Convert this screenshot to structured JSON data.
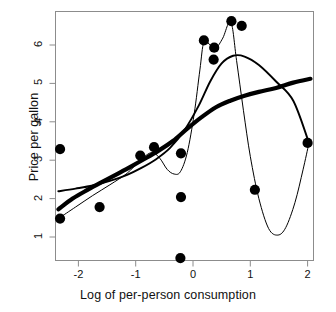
{
  "chart_data": {
    "type": "scatter",
    "title": "",
    "xlabel": "Log of per-person consumption",
    "ylabel": "Price per gallon",
    "xlim": [
      -2.62,
      -2.62
    ],
    "x_range": [
      -2.62,
      2.27
    ],
    "y_range": [
      0.2,
      6.95
    ],
    "xticks": [
      -2,
      -1,
      0,
      1,
      2
    ],
    "xtick_labels": [
      "-2",
      "-1",
      "0",
      "1",
      "2"
    ],
    "yticks": [
      1,
      2,
      3,
      4,
      5,
      6
    ],
    "ytick_labels": [
      "1",
      "2",
      "3",
      "4",
      "5",
      "6"
    ],
    "grid": false,
    "legend": "none",
    "points": [
      {
        "x": -2.32,
        "y": 3.29
      },
      {
        "x": -2.32,
        "y": 1.48
      },
      {
        "x": -1.63,
        "y": 1.78
      },
      {
        "x": -0.92,
        "y": 3.12
      },
      {
        "x": -0.68,
        "y": 3.34
      },
      {
        "x": -0.21,
        "y": 3.18
      },
      {
        "x": -0.21,
        "y": 2.04
      },
      {
        "x": -0.22,
        "y": 0.45
      },
      {
        "x": 0.19,
        "y": 6.12
      },
      {
        "x": 0.37,
        "y": 5.93
      },
      {
        "x": 0.36,
        "y": 5.62
      },
      {
        "x": 0.67,
        "y": 6.62
      },
      {
        "x": 0.85,
        "y": 6.5
      },
      {
        "x": 1.08,
        "y": 2.23
      },
      {
        "x": 2.0,
        "y": 3.45
      }
    ],
    "series": [
      {
        "name": "thick-smooth-curve",
        "type": "line",
        "style": "thick",
        "points": [
          {
            "x": -2.35,
            "y": 1.72
          },
          {
            "x": -2.1,
            "y": 2.0
          },
          {
            "x": -1.85,
            "y": 2.22
          },
          {
            "x": -1.6,
            "y": 2.42
          },
          {
            "x": -1.35,
            "y": 2.62
          },
          {
            "x": -1.1,
            "y": 2.82
          },
          {
            "x": -0.85,
            "y": 3.03
          },
          {
            "x": -0.6,
            "y": 3.25
          },
          {
            "x": -0.35,
            "y": 3.5
          },
          {
            "x": -0.1,
            "y": 3.82
          },
          {
            "x": 0.15,
            "y": 4.12
          },
          {
            "x": 0.4,
            "y": 4.38
          },
          {
            "x": 0.65,
            "y": 4.55
          },
          {
            "x": 0.9,
            "y": 4.68
          },
          {
            "x": 1.15,
            "y": 4.78
          },
          {
            "x": 1.45,
            "y": 4.88
          },
          {
            "x": 1.75,
            "y": 5.02
          },
          {
            "x": 2.05,
            "y": 5.12
          }
        ]
      },
      {
        "name": "medium-smooth-curve",
        "type": "line",
        "style": "medium",
        "points": [
          {
            "x": -2.35,
            "y": 2.19
          },
          {
            "x": -2.05,
            "y": 2.26
          },
          {
            "x": -1.75,
            "y": 2.34
          },
          {
            "x": -1.45,
            "y": 2.46
          },
          {
            "x": -1.15,
            "y": 2.62
          },
          {
            "x": -0.9,
            "y": 2.8
          },
          {
            "x": -0.65,
            "y": 3.02
          },
          {
            "x": -0.4,
            "y": 3.32
          },
          {
            "x": -0.15,
            "y": 3.78
          },
          {
            "x": 0.1,
            "y": 4.42
          },
          {
            "x": 0.3,
            "y": 5.05
          },
          {
            "x": 0.5,
            "y": 5.52
          },
          {
            "x": 0.7,
            "y": 5.72
          },
          {
            "x": 0.9,
            "y": 5.7
          },
          {
            "x": 1.15,
            "y": 5.48
          },
          {
            "x": 1.45,
            "y": 5.05
          },
          {
            "x": 1.75,
            "y": 4.55
          },
          {
            "x": 2.02,
            "y": 3.47
          }
        ]
      },
      {
        "name": "thin-wiggly-curve",
        "type": "line",
        "style": "thin",
        "points": [
          {
            "x": -2.33,
            "y": 1.5
          },
          {
            "x": -2.05,
            "y": 1.78
          },
          {
            "x": -1.75,
            "y": 2.08
          },
          {
            "x": -1.45,
            "y": 2.36
          },
          {
            "x": -1.15,
            "y": 2.66
          },
          {
            "x": -0.92,
            "y": 3.0
          },
          {
            "x": -0.72,
            "y": 3.2
          },
          {
            "x": -0.58,
            "y": 3.05
          },
          {
            "x": -0.45,
            "y": 2.76
          },
          {
            "x": -0.33,
            "y": 2.64
          },
          {
            "x": -0.22,
            "y": 2.7
          },
          {
            "x": -0.1,
            "y": 3.2
          },
          {
            "x": 0.02,
            "y": 4.2
          },
          {
            "x": 0.12,
            "y": 5.35
          },
          {
            "x": 0.19,
            "y": 6.08
          },
          {
            "x": 0.3,
            "y": 6.0
          },
          {
            "x": 0.4,
            "y": 5.92
          },
          {
            "x": 0.52,
            "y": 6.18
          },
          {
            "x": 0.66,
            "y": 6.6
          },
          {
            "x": 0.76,
            "y": 5.6
          },
          {
            "x": 0.88,
            "y": 4.3
          },
          {
            "x": 1.0,
            "y": 3.1
          },
          {
            "x": 1.15,
            "y": 2.0
          },
          {
            "x": 1.32,
            "y": 1.22
          },
          {
            "x": 1.48,
            "y": 1.05
          },
          {
            "x": 1.62,
            "y": 1.25
          },
          {
            "x": 1.78,
            "y": 1.9
          },
          {
            "x": 1.92,
            "y": 2.75
          },
          {
            "x": 2.02,
            "y": 3.42
          }
        ]
      }
    ]
  },
  "style": {
    "frame_color": "#8c8c8c",
    "point_color": "#000000",
    "axis_text_color": "#111111"
  }
}
